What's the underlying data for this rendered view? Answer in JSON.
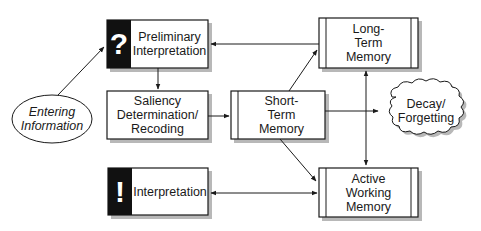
{
  "diagram": {
    "type": "flowchart",
    "nodes": {
      "entering_information": {
        "label": "Entering\nInformation",
        "shape": "ellipse"
      },
      "preliminary_interpretation": {
        "label": "Preliminary\nInterpretation",
        "icon": "?",
        "shape": "box-with-icon"
      },
      "saliency": {
        "label": "Saliency\nDetermination/\nRecoding",
        "shape": "box"
      },
      "interpretation": {
        "label": "Interpretation",
        "icon": "!",
        "shape": "box-with-icon"
      },
      "short_term_memory": {
        "label": "Short-\nTerm\nMemory",
        "shape": "process-box"
      },
      "long_term_memory": {
        "label": "Long-\nTerm\nMemory",
        "shape": "process-box"
      },
      "active_working_memory": {
        "label": "Active\nWorking\nMemory",
        "shape": "process-box"
      },
      "decay_forgetting": {
        "label": "Decay/\nForgetting",
        "shape": "cloud"
      }
    },
    "edges": [
      {
        "from": "entering_information",
        "to": "preliminary_interpretation"
      },
      {
        "from": "preliminary_interpretation",
        "to": "saliency"
      },
      {
        "from": "saliency",
        "to": "short_term_memory"
      },
      {
        "from": "short_term_memory",
        "to": "long_term_memory"
      },
      {
        "from": "short_term_memory",
        "to": "decay_forgetting"
      },
      {
        "from": "short_term_memory",
        "to": "active_working_memory"
      },
      {
        "from": "long_term_memory",
        "to": "preliminary_interpretation"
      },
      {
        "from": "long_term_memory",
        "to": "active_working_memory",
        "bidirectional": true
      },
      {
        "from": "interpretation",
        "to": "active_working_memory",
        "bidirectional": true
      }
    ],
    "colors": {
      "stroke": "#1a1a1a",
      "icon_fill": "#111111",
      "shadow": "#b5b5b5",
      "background": "#ffffff"
    }
  }
}
